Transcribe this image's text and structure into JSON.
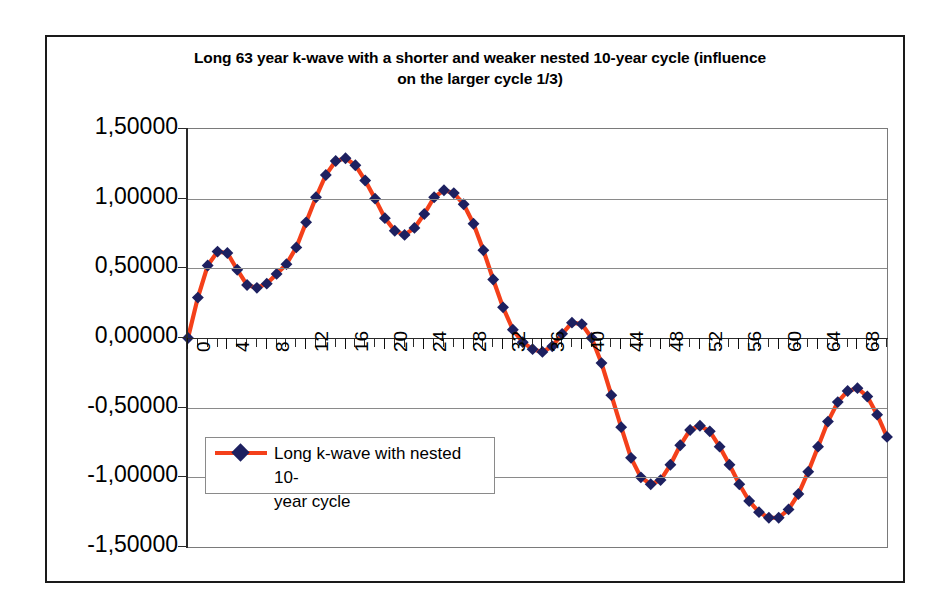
{
  "chart_data": {
    "type": "line",
    "title": "Long 63 year k-wave with a shorter and weaker nested 10-year cycle (influence on the larger cycle 1/3)",
    "title_line1": "Long 63 year k-wave with a shorter and weaker nested 10-year cycle (influence",
    "title_line2": "on the larger cycle 1/3)",
    "xlabel": "",
    "ylabel": "",
    "ylim": [
      -1.5,
      1.5
    ],
    "xlim": [
      0,
      71
    ],
    "grid": true,
    "legend_position": "inside-lower-left",
    "decimal_separator": ",",
    "series": [
      {
        "name": "Long k-wave with nested 10-year cycle",
        "color": "#f4401a",
        "marker_color": "#1d2060",
        "marker": "diamond",
        "x": [
          0,
          1,
          2,
          3,
          4,
          5,
          6,
          7,
          8,
          9,
          10,
          11,
          12,
          13,
          14,
          15,
          16,
          17,
          18,
          19,
          20,
          21,
          22,
          23,
          24,
          25,
          26,
          27,
          28,
          29,
          30,
          31,
          32,
          33,
          34,
          35,
          36,
          37,
          38,
          39,
          40,
          41,
          42,
          43,
          44,
          45,
          46,
          47,
          48,
          49,
          50,
          51,
          52,
          53,
          54,
          55,
          56,
          57,
          58,
          59,
          60,
          61,
          62,
          63,
          64,
          65,
          66,
          67,
          68,
          69,
          70,
          71
        ],
        "values": [
          0.0,
          0.29,
          0.52,
          0.62,
          0.61,
          0.49,
          0.38,
          0.36,
          0.39,
          0.46,
          0.53,
          0.65,
          0.83,
          1.01,
          1.17,
          1.27,
          1.29,
          1.24,
          1.13,
          1.0,
          0.86,
          0.77,
          0.74,
          0.79,
          0.89,
          1.01,
          1.06,
          1.04,
          0.96,
          0.82,
          0.63,
          0.42,
          0.22,
          0.06,
          -0.03,
          -0.08,
          -0.1,
          -0.06,
          0.03,
          0.11,
          0.1,
          0.0,
          -0.18,
          -0.41,
          -0.64,
          -0.86,
          -1.0,
          -1.05,
          -1.02,
          -0.91,
          -0.77,
          -0.66,
          -0.63,
          -0.67,
          -0.78,
          -0.91,
          -1.05,
          -1.17,
          -1.25,
          -1.29,
          -1.29,
          -1.23,
          -1.12,
          -0.96,
          -0.78,
          -0.6,
          -0.46,
          -0.38,
          -0.36,
          -0.42,
          -0.55,
          -0.71
        ]
      }
    ],
    "y_ticks": [
      1.5,
      1.0,
      0.5,
      0.0,
      -0.5,
      -1.0,
      -1.5
    ],
    "y_tick_labels": [
      "1,50000",
      "1,00000",
      "0,50000",
      "0,00000",
      "-0,50000",
      "-1,00000",
      "-1,50000"
    ],
    "x_tick_labels": [
      "0",
      "4",
      "8",
      "12",
      "16",
      "20",
      "24",
      "28",
      "32",
      "36",
      "40",
      "44",
      "48",
      "52",
      "56",
      "60",
      "64",
      "68"
    ],
    "x_tick_values": [
      0,
      4,
      8,
      12,
      16,
      20,
      24,
      28,
      32,
      36,
      40,
      44,
      48,
      52,
      56,
      60,
      64,
      68
    ],
    "x_tick_interval": 1,
    "legend_entries": [
      {
        "label_line1": "Long k-wave with nested 10-",
        "label_line2": "year cycle",
        "color": "#f4401a"
      }
    ]
  },
  "colors": {
    "line": "#f4401a",
    "marker": "#1d2060",
    "grid": "#8a8a8a",
    "axis": "#2a2a2a",
    "frame": "#1a1a1a",
    "background": "#ffffff"
  }
}
